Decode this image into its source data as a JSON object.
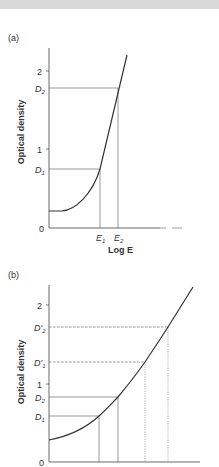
{
  "figure": {
    "panel_a": {
      "label": "(a)",
      "ylabel": "Optical density",
      "xlabel": "Log E",
      "y_ticks": [
        "2",
        "1",
        "0"
      ],
      "y_markers": [
        {
          "base": "D",
          "sub": "2"
        },
        {
          "base": "D",
          "sub": "1"
        }
      ],
      "x_markers": [
        {
          "base": "E",
          "sub": "1"
        },
        {
          "base": "E",
          "sub": "2"
        }
      ]
    },
    "panel_b": {
      "label": "(b)",
      "ylabel": "Optical density",
      "y_ticks": [
        "2",
        "1",
        "0"
      ],
      "y_markers": [
        {
          "base": "D'",
          "sub": "2"
        },
        {
          "base": "D'",
          "sub": "1"
        },
        {
          "base": "D",
          "sub": "2"
        },
        {
          "base": "D",
          "sub": "1"
        }
      ]
    }
  },
  "colors": {
    "line": "#333333",
    "guide": "#555555",
    "band": "#d9d9d9"
  }
}
